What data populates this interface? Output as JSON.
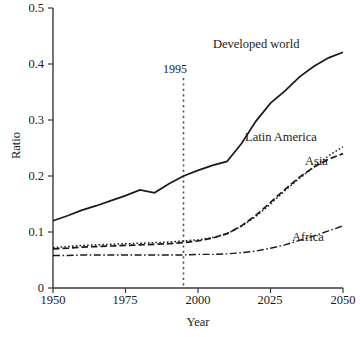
{
  "chart_data": {
    "type": "line",
    "title": "",
    "xlabel": "Year",
    "ylabel": "Ratio",
    "xlim": [
      1950,
      2050
    ],
    "ylim": [
      0,
      0.5
    ],
    "xticks": [
      "1950",
      "1975",
      "2000",
      "2025",
      "2050"
    ],
    "yticks": [
      "0",
      "0.1",
      "0.2",
      "0.3",
      "0.4",
      "0.5"
    ],
    "grid": false,
    "legend_position": "inline-labels",
    "annotations": [
      {
        "name": "vertical-marker-1995",
        "label": "1995",
        "x": 1995,
        "style": "dotted-vertical-line"
      }
    ],
    "x": [
      1950,
      1955,
      1960,
      1965,
      1970,
      1975,
      1980,
      1985,
      1990,
      1995,
      2000,
      2005,
      2010,
      2015,
      2020,
      2025,
      2030,
      2035,
      2040,
      2045,
      2050
    ],
    "series": [
      {
        "name": "Developed world",
        "style": "solid",
        "values": [
          0.12,
          0.129,
          0.139,
          0.147,
          0.156,
          0.165,
          0.175,
          0.17,
          0.186,
          0.2,
          0.21,
          0.219,
          0.226,
          0.258,
          0.298,
          0.33,
          0.352,
          0.377,
          0.396,
          0.411,
          0.421
        ]
      },
      {
        "name": "Latin America",
        "style": "dotted",
        "values": [
          0.072,
          0.074,
          0.076,
          0.077,
          0.078,
          0.079,
          0.08,
          0.081,
          0.082,
          0.084,
          0.086,
          0.09,
          0.097,
          0.11,
          0.128,
          0.15,
          0.174,
          0.196,
          0.216,
          0.236,
          0.252
        ]
      },
      {
        "name": "Asia",
        "style": "dashed",
        "values": [
          0.07,
          0.071,
          0.073,
          0.074,
          0.075,
          0.076,
          0.077,
          0.078,
          0.079,
          0.081,
          0.084,
          0.089,
          0.097,
          0.111,
          0.13,
          0.153,
          0.176,
          0.198,
          0.216,
          0.23,
          0.24
        ]
      },
      {
        "name": "Africa",
        "style": "dash-dot",
        "values": [
          0.058,
          0.058,
          0.059,
          0.059,
          0.059,
          0.059,
          0.059,
          0.059,
          0.059,
          0.059,
          0.06,
          0.06,
          0.061,
          0.063,
          0.066,
          0.071,
          0.077,
          0.085,
          0.093,
          0.102,
          0.111
        ]
      }
    ],
    "series_labels": [
      {
        "text": "Developed world",
        "x": 213,
        "y": 44
      },
      {
        "text": "Latin America",
        "x": 245,
        "y": 137
      },
      {
        "text": "Asia",
        "x": 305,
        "y": 161
      },
      {
        "text": "Africa",
        "x": 292,
        "y": 237
      }
    ]
  },
  "axes": {
    "ylabel": "Ratio",
    "xlabel": "Year",
    "ytick_labels": [
      "0.5",
      "0.4",
      "0.3",
      "0.2",
      "0.1",
      "0"
    ],
    "xtick_labels": [
      "1950",
      "1975",
      "2000",
      "2025",
      "2050"
    ]
  },
  "colors": {
    "line": "#1a1a1a",
    "axis": "#3a3a3a",
    "background": "#ffffff",
    "marker": "#555555"
  }
}
